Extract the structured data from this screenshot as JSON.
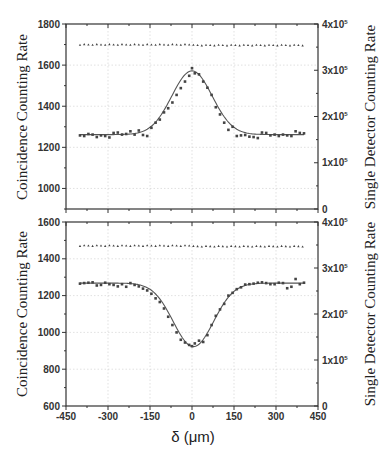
{
  "chart_data": [
    {
      "type": "scatter",
      "panel": "top",
      "title": "",
      "xlabel": "δ (μm)",
      "ylabel": "Coincidence Counting Rate",
      "ylabel_right": "Single Detector Counting Rate",
      "xlim": [
        -450,
        450
      ],
      "ylim": [
        900,
        1800
      ],
      "ylim_right": [
        0,
        400000
      ],
      "xticks": [
        -450,
        -300,
        -150,
        0,
        150,
        300,
        450
      ],
      "yticks": [
        1000,
        1200,
        1400,
        1600,
        1800
      ],
      "yticks_labels": [
        "1000",
        "1200",
        "1400",
        "1600",
        "1800"
      ],
      "yticks_right": [
        0,
        100000,
        200000,
        300000,
        400000
      ],
      "yticks_right_labels": [
        "0",
        "1x10^5",
        "2x10^5",
        "3x10^5",
        "4x10^5"
      ],
      "grid": true,
      "series": [
        {
          "name": "Coincidence counts (peak)",
          "marker": "square",
          "axis": "left",
          "x": [
            -400,
            -385,
            -370,
            -355,
            -340,
            -325,
            -310,
            -295,
            -280,
            -265,
            -250,
            -235,
            -220,
            -205,
            -190,
            -175,
            -160,
            -145,
            -130,
            -115,
            -100,
            -85,
            -70,
            -55,
            -40,
            -25,
            -10,
            0,
            10,
            25,
            40,
            55,
            70,
            85,
            100,
            115,
            130,
            145,
            160,
            175,
            190,
            205,
            220,
            235,
            250,
            265,
            280,
            295,
            310,
            325,
            340,
            355,
            370,
            385,
            400
          ],
          "y": [
            1258,
            1255,
            1265,
            1262,
            1250,
            1258,
            1255,
            1248,
            1270,
            1272,
            1262,
            1265,
            1278,
            1262,
            1282,
            1260,
            1255,
            1295,
            1320,
            1335,
            1370,
            1390,
            1418,
            1455,
            1488,
            1520,
            1548,
            1585,
            1560,
            1555,
            1520,
            1490,
            1455,
            1395,
            1360,
            1320,
            1285,
            1300,
            1255,
            1258,
            1260,
            1252,
            1250,
            1245,
            1272,
            1270,
            1258,
            1262,
            1255,
            1262,
            1258,
            1255,
            1278,
            1270,
            1268
          ]
        },
        {
          "name": "Gaussian fit",
          "type": "line",
          "axis": "left",
          "baseline": 1262,
          "amplitude": 310,
          "center": 0,
          "sigma": 72
        },
        {
          "name": "Single detector counts",
          "marker": "triangle",
          "axis": "right",
          "x_range": [
            -400,
            400
          ],
          "value": 355000
        }
      ]
    },
    {
      "type": "scatter",
      "panel": "bottom",
      "title": "",
      "xlabel": "δ (μm)",
      "ylabel": "Coincidence Counting Rate",
      "ylabel_right": "Single Detector Counting Rate",
      "xlim": [
        -450,
        450
      ],
      "ylim": [
        600,
        1600
      ],
      "ylim_right": [
        0,
        400000
      ],
      "xticks": [
        -450,
        -300,
        -150,
        0,
        150,
        300,
        450
      ],
      "xticks_labels": [
        "-450",
        "-300",
        "-150",
        "0",
        "150",
        "300",
        "450"
      ],
      "yticks": [
        600,
        800,
        1000,
        1200,
        1400,
        1600
      ],
      "yticks_labels": [
        "600",
        "800",
        "1000",
        "1200",
        "1400",
        "1600"
      ],
      "yticks_right": [
        0,
        100000,
        200000,
        300000,
        400000
      ],
      "yticks_right_labels": [
        "0",
        "1x10^5",
        "2x10^5",
        "3x10^5",
        "4x10^5"
      ],
      "grid": true,
      "series": [
        {
          "name": "Coincidence counts (dip)",
          "marker": "square",
          "axis": "left",
          "x": [
            -400,
            -385,
            -370,
            -355,
            -340,
            -325,
            -310,
            -295,
            -280,
            -265,
            -250,
            -235,
            -220,
            -205,
            -190,
            -175,
            -160,
            -145,
            -130,
            -115,
            -100,
            -85,
            -70,
            -55,
            -40,
            -25,
            -10,
            0,
            10,
            25,
            40,
            55,
            70,
            85,
            100,
            115,
            130,
            145,
            160,
            175,
            190,
            205,
            220,
            235,
            250,
            265,
            280,
            295,
            310,
            325,
            340,
            355,
            370,
            385,
            400
          ],
          "y": [
            1265,
            1268,
            1270,
            1272,
            1255,
            1258,
            1270,
            1262,
            1258,
            1250,
            1262,
            1248,
            1268,
            1258,
            1250,
            1238,
            1228,
            1210,
            1185,
            1165,
            1130,
            1085,
            1040,
            1000,
            960,
            945,
            932,
            925,
            940,
            955,
            948,
            985,
            1040,
            1090,
            1125,
            1155,
            1200,
            1215,
            1235,
            1245,
            1260,
            1262,
            1265,
            1270,
            1272,
            1268,
            1262,
            1262,
            1270,
            1268,
            1240,
            1248,
            1290,
            1262,
            1270
          ]
        },
        {
          "name": "Gaussian fit",
          "type": "line",
          "axis": "left",
          "baseline": 1268,
          "amplitude": -345,
          "center": 5,
          "sigma": 72
        },
        {
          "name": "Single detector counts",
          "marker": "triangle",
          "axis": "right",
          "x_range": [
            -400,
            400
          ],
          "value": 348000
        }
      ]
    }
  ],
  "labels": {
    "ylabel_left": "Coincidence Counting Rate",
    "ylabel_right": "Single Detector Counting Rate",
    "xlabel": "δ (μm)"
  },
  "colors": {
    "axis": "#333333",
    "grid": "#cccccc",
    "marker": "#444444",
    "fit": "#555555",
    "background": "#ffffff"
  }
}
